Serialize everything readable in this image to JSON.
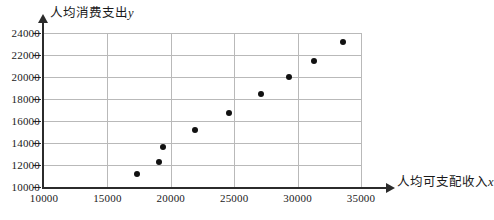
{
  "chart_data": {
    "type": "scatter",
    "title": "",
    "xlabel": "人均可支配收入x",
    "ylabel": "人均消费支出y",
    "xlim": [
      10000,
      35000
    ],
    "ylim": [
      10000,
      24000
    ],
    "xticks": [
      10000,
      15000,
      20000,
      25000,
      30000,
      35000
    ],
    "yticks": [
      10000,
      12000,
      14000,
      16000,
      18000,
      20000,
      22000,
      24000
    ],
    "xtick_labels": [
      "10000",
      "15000",
      "20000",
      "25000",
      "30000",
      "35000"
    ],
    "ytick_labels": [
      "10000",
      "12000",
      "14000",
      "16000",
      "18000",
      "20000",
      "22000",
      "24000"
    ],
    "grid": true,
    "legend": "none",
    "marker": "filled-circle",
    "marker_color": "#111111",
    "points": [
      {
        "x": 17300,
        "y": 11200
      },
      {
        "x": 19100,
        "y": 12250
      },
      {
        "x": 19400,
        "y": 13600
      },
      {
        "x": 21900,
        "y": 15200
      },
      {
        "x": 24600,
        "y": 16700
      },
      {
        "x": 27100,
        "y": 18500
      },
      {
        "x": 29300,
        "y": 20000
      },
      {
        "x": 31300,
        "y": 21500
      },
      {
        "x": 33600,
        "y": 23200
      }
    ]
  },
  "axes": {
    "y_title_text": "人均消费支出",
    "y_title_var": "y",
    "x_title_text": "人均可支配收入",
    "x_title_var": "x"
  },
  "colors": {
    "axis": "#2b2b2b",
    "grid": "#b9b9b9",
    "marker": "#111111",
    "background": "#ffffff"
  }
}
